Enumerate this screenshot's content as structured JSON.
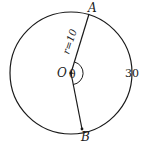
{
  "diagram": {
    "type": "circle-geometry",
    "labels": {
      "point_a": "A",
      "point_b": "B",
      "center": "O",
      "angle": "θ",
      "radius": "r=10",
      "arc_length": "30"
    },
    "geometry": {
      "center": [
        71,
        73
      ],
      "radius": 61,
      "point_a": [
        89,
        14
      ],
      "point_b": [
        82,
        129
      ]
    },
    "colors": {
      "stroke": "#1a1a1a",
      "background": "#ffffff"
    }
  }
}
